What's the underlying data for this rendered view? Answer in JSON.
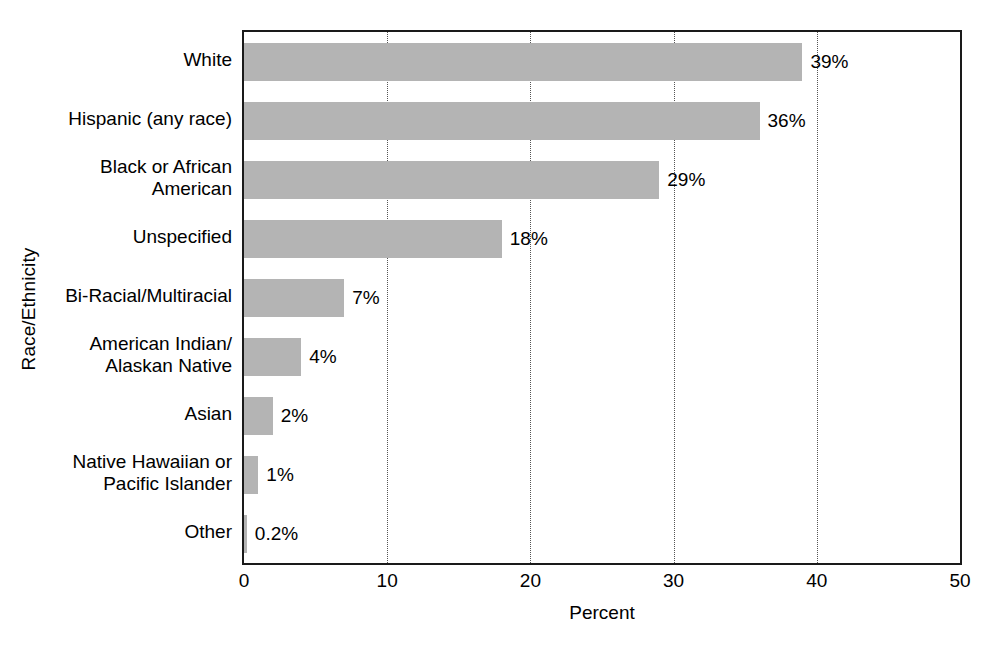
{
  "chart_data": {
    "type": "bar",
    "orientation": "horizontal",
    "title": "",
    "xlabel": "Percent",
    "ylabel": "Race/Ethnicity",
    "xlim": [
      0,
      50
    ],
    "xticks": [
      "0",
      "10",
      "20",
      "30",
      "40",
      "50"
    ],
    "xtick_values": [
      0,
      10,
      20,
      30,
      40,
      50
    ],
    "grid": "vertical dotted gridlines at 10, 20, 30, 40",
    "legend": "none",
    "bar_color": "#b4b4b4",
    "frame_color": "#1a1a1a",
    "categories": [
      "White",
      "Hispanic (any race)",
      "Black or African\nAmerican",
      "Unspecified",
      "Bi-Racial/Multiracial",
      "American Indian/\nAlaskan Native",
      "Asian",
      "Native Hawaiian or\nPacific Islander",
      "Other"
    ],
    "values": [
      39,
      36,
      29,
      18,
      7,
      4,
      2,
      1,
      0.2
    ],
    "value_labels": [
      "39%",
      "36%",
      "29%",
      "18%",
      "7%",
      "4%",
      "2%",
      "1%",
      "0.2%"
    ]
  }
}
